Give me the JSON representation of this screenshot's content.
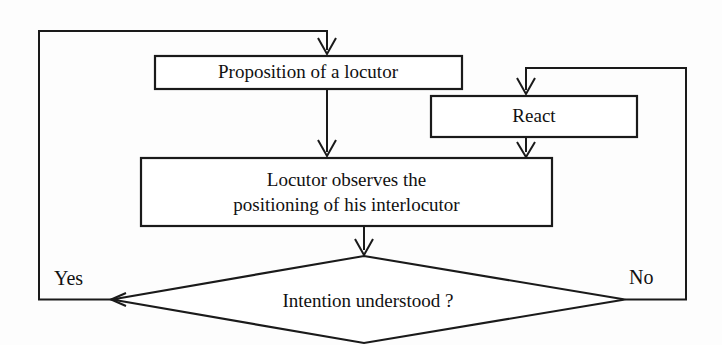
{
  "diagram": {
    "type": "flowchart",
    "background_color": "#fdfdfd",
    "stroke_color": "#1a1a1a",
    "text_color": "#111111",
    "nodes": [
      {
        "id": "proposition",
        "shape": "rectangle",
        "label": "Proposition of a locutor"
      },
      {
        "id": "react",
        "shape": "rectangle",
        "label": "React"
      },
      {
        "id": "observe",
        "shape": "rectangle",
        "label_line1": "Locutor observes the",
        "label_line2": "positioning of his interlocutor"
      },
      {
        "id": "decision",
        "shape": "diamond",
        "label": "Intention understood ?"
      }
    ],
    "edge_labels": {
      "yes": "Yes",
      "no": "No"
    }
  }
}
